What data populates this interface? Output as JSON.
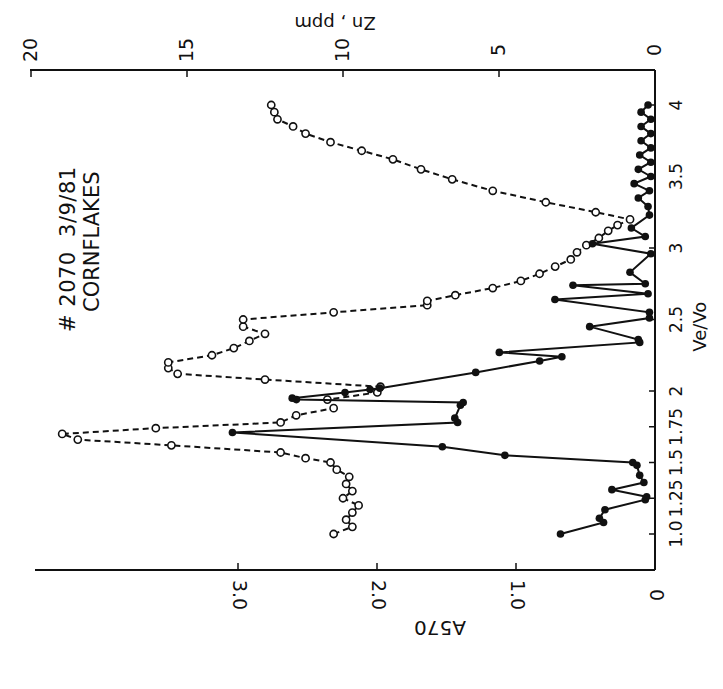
{
  "annotation": {
    "line1": "# 2070  3/9/81",
    "line2": "CORNFLAKES"
  },
  "axes": {
    "x": {
      "label": "Ve/Vo",
      "ticks": [
        "1.0",
        "1.25",
        "1.5",
        "1.75",
        "2",
        "2.5",
        "3",
        "3.5",
        "4"
      ],
      "tick_values": [
        1.0,
        1.25,
        1.5,
        1.75,
        2.0,
        2.5,
        3.0,
        3.5,
        4.0
      ]
    },
    "y_left": {
      "label": "A570",
      "ticks": [
        "0",
        "1.0",
        "2.0",
        "3.0"
      ],
      "tick_values": [
        0,
        1.0,
        2.0,
        3.0
      ]
    },
    "y_right": {
      "label": "Zn , ppm",
      "ticks": [
        "0",
        "5",
        "10",
        "15",
        "20"
      ],
      "tick_values": [
        0,
        5,
        10,
        15,
        20
      ]
    }
  },
  "chart_data": {
    "type": "line",
    "title": "# 2070 3/9/81 CORNFLAKES",
    "orientation_note": "figure printed rotated 90 degrees counter-clockwise",
    "xlabel": "Ve/Vo",
    "ylabel": "A570",
    "y2label": "Zn , ppm",
    "xlim": [
      0.8,
      4.1
    ],
    "ylim": [
      0,
      4.4
    ],
    "y2lim": [
      0,
      20
    ],
    "grid": false,
    "legend": "none",
    "series": [
      {
        "name": "A570",
        "style": "solid line, filled circles",
        "axis": "left",
        "x": [
          1.0,
          1.08,
          1.11,
          1.17,
          1.24,
          1.26,
          1.31,
          1.36,
          1.41,
          1.48,
          1.5,
          1.55,
          1.61,
          1.71,
          1.78,
          1.81,
          1.9,
          1.92,
          1.94,
          1.95,
          1.99,
          2.01,
          2.02,
          2.13,
          2.21,
          2.24,
          2.27,
          2.34,
          2.36,
          2.45,
          2.51,
          2.55,
          2.64,
          2.68,
          2.74,
          2.75,
          2.83,
          2.96,
          3.03,
          3.08,
          3.14,
          3.23,
          3.29,
          3.35,
          3.4,
          3.45,
          3.5,
          3.55,
          3.6,
          3.65,
          3.7,
          3.75,
          3.8,
          3.85,
          3.9,
          3.95,
          4.0
        ],
        "values": [
          0.68,
          0.37,
          0.4,
          0.36,
          0.07,
          0.06,
          0.31,
          0.08,
          0.11,
          0.13,
          0.16,
          1.08,
          1.53,
          3.04,
          1.42,
          1.44,
          1.4,
          1.38,
          2.58,
          2.61,
          2.23,
          2.05,
          1.98,
          1.29,
          0.83,
          0.67,
          1.12,
          0.11,
          0.12,
          0.47,
          0.04,
          0.04,
          0.72,
          0.05,
          0.59,
          0.07,
          0.18,
          0.03,
          0.45,
          0.07,
          0.17,
          0.04,
          0.05,
          0.12,
          0.04,
          0.15,
          0.03,
          0.12,
          0.03,
          0.11,
          0.03,
          0.1,
          0.03,
          0.1,
          0.03,
          0.1,
          0.05
        ]
      },
      {
        "name": "Zn, ppm",
        "style": "dashed line, open circles",
        "axis": "right",
        "x": [
          1.0,
          1.05,
          1.1,
          1.15,
          1.2,
          1.25,
          1.3,
          1.35,
          1.4,
          1.45,
          1.5,
          1.53,
          1.57,
          1.62,
          1.66,
          1.7,
          1.74,
          1.78,
          1.83,
          1.88,
          1.94,
          1.99,
          2.03,
          2.08,
          2.12,
          2.16,
          2.2,
          2.25,
          2.3,
          2.35,
          2.4,
          2.45,
          2.5,
          2.55,
          2.6,
          2.63,
          2.67,
          2.72,
          2.77,
          2.82,
          2.87,
          2.92,
          2.97,
          3.02,
          3.07,
          3.12,
          3.16,
          3.2,
          3.25,
          3.32,
          3.4,
          3.48,
          3.55,
          3.62,
          3.68,
          3.74,
          3.8,
          3.85,
          3.9,
          3.95,
          4.0
        ],
        "values": [
          10.3,
          9.7,
          9.9,
          9.7,
          9.5,
          10.0,
          9.7,
          9.9,
          9.8,
          10.2,
          10.4,
          11.2,
          12.0,
          15.5,
          18.5,
          19.0,
          16.0,
          12.0,
          11.5,
          10.3,
          10.5,
          8.9,
          8.8,
          12.5,
          15.3,
          15.6,
          15.6,
          14.2,
          13.5,
          13.0,
          12.5,
          13.2,
          13.2,
          10.3,
          7.3,
          7.3,
          6.4,
          5.2,
          4.3,
          3.7,
          3.2,
          2.7,
          2.5,
          2.2,
          1.8,
          1.5,
          1.2,
          0.8,
          1.9,
          3.5,
          5.2,
          6.5,
          7.5,
          8.4,
          9.4,
          10.4,
          11.2,
          11.6,
          12.1,
          12.2,
          12.3
        ]
      }
    ]
  }
}
